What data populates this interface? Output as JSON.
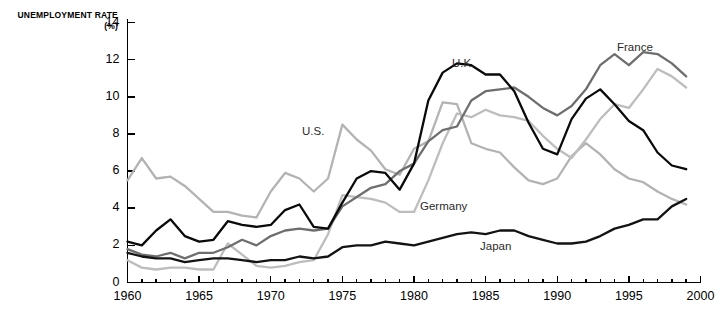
{
  "chart_data": {
    "type": "line",
    "title": "UNEMPLOYMENT RATE (%)",
    "xlabel": "",
    "ylabel": "UNEMPLOYMENT RATE (%)",
    "xlim": [
      1960,
      2000
    ],
    "ylim": [
      0,
      14
    ],
    "yticks": [
      0,
      2,
      4,
      6,
      8,
      10,
      12,
      14
    ],
    "xticks": [
      1960,
      1965,
      1970,
      1975,
      1980,
      1985,
      1990,
      1995,
      2000
    ],
    "x_minor_tick_step": 1,
    "grid": false,
    "legend_position": "inline-annotations",
    "x": [
      1960,
      1961,
      1962,
      1963,
      1964,
      1965,
      1966,
      1967,
      1968,
      1969,
      1970,
      1971,
      1972,
      1973,
      1974,
      1975,
      1976,
      1977,
      1978,
      1979,
      1980,
      1981,
      1982,
      1983,
      1984,
      1985,
      1986,
      1987,
      1988,
      1989,
      1990,
      1991,
      1992,
      1993,
      1994,
      1995,
      1996,
      1997,
      1998,
      1999
    ],
    "series": [
      {
        "name": "U.S.",
        "color": "#b3b3b3",
        "values": [
          5.5,
          6.7,
          5.6,
          5.7,
          5.2,
          4.5,
          3.8,
          3.8,
          3.6,
          3.5,
          4.9,
          5.9,
          5.6,
          4.9,
          5.6,
          8.5,
          7.7,
          7.1,
          6.1,
          5.8,
          7.2,
          7.6,
          9.7,
          9.6,
          7.5,
          7.2,
          7.0,
          6.2,
          5.5,
          5.3,
          5.6,
          6.8,
          7.5,
          6.9,
          6.1,
          5.6,
          5.4,
          4.9,
          4.5,
          4.2
        ]
      },
      {
        "name": "Germany",
        "color": "#bdbdbd",
        "values": [
          1.2,
          0.8,
          0.7,
          0.8,
          0.8,
          0.7,
          0.7,
          2.1,
          1.5,
          0.9,
          0.8,
          0.9,
          1.1,
          1.2,
          2.6,
          4.7,
          4.6,
          4.5,
          4.3,
          3.8,
          3.8,
          5.5,
          7.5,
          9.1,
          8.9,
          9.3,
          9.0,
          8.9,
          8.7,
          7.9,
          7.2,
          6.7,
          7.7,
          8.8,
          9.6,
          9.4,
          10.4,
          11.5,
          11.1,
          10.5
        ]
      },
      {
        "name": "France",
        "color": "#6e6e6e",
        "values": [
          1.8,
          1.5,
          1.4,
          1.6,
          1.3,
          1.6,
          1.6,
          1.9,
          2.3,
          2.0,
          2.5,
          2.8,
          2.9,
          2.8,
          2.9,
          4.1,
          4.6,
          5.1,
          5.3,
          6.0,
          6.4,
          7.6,
          8.2,
          8.4,
          9.8,
          10.3,
          10.4,
          10.5,
          10.0,
          9.4,
          9.0,
          9.5,
          10.4,
          11.7,
          12.3,
          11.7,
          12.4,
          12.3,
          11.8,
          11.1
        ]
      },
      {
        "name": "U.K.",
        "color": "#0a0a0a",
        "values": [
          2.2,
          2.0,
          2.8,
          3.4,
          2.5,
          2.2,
          2.3,
          3.3,
          3.1,
          3.0,
          3.1,
          3.9,
          4.2,
          3.0,
          2.9,
          4.3,
          5.6,
          6.0,
          5.9,
          5.0,
          6.4,
          9.8,
          11.3,
          11.8,
          11.7,
          11.2,
          11.2,
          10.3,
          8.6,
          7.2,
          6.9,
          8.8,
          9.9,
          10.4,
          9.6,
          8.7,
          8.2,
          7.0,
          6.3,
          6.1
        ]
      },
      {
        "name": "Japan",
        "color": "#131313",
        "values": [
          1.6,
          1.4,
          1.3,
          1.3,
          1.1,
          1.2,
          1.3,
          1.3,
          1.2,
          1.1,
          1.2,
          1.2,
          1.4,
          1.3,
          1.4,
          1.9,
          2.0,
          2.0,
          2.2,
          2.1,
          2.0,
          2.2,
          2.4,
          2.6,
          2.7,
          2.6,
          2.8,
          2.8,
          2.5,
          2.3,
          2.1,
          2.1,
          2.2,
          2.5,
          2.9,
          3.1,
          3.4,
          3.4,
          4.1,
          4.5
        ]
      }
    ],
    "annotations": [
      {
        "text": "U.S.",
        "x_px": 302,
        "y_px": 125
      },
      {
        "text": "U.K.",
        "x_px": 452,
        "y_px": 57
      },
      {
        "text": "France",
        "x_px": 617,
        "y_px": 41
      },
      {
        "text": "Germany",
        "x_px": 420,
        "y_px": 200
      },
      {
        "text": "Japan",
        "x_px": 480,
        "y_px": 240
      }
    ]
  }
}
